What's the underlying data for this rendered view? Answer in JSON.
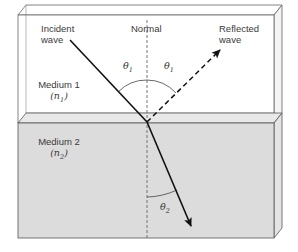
{
  "diagram": {
    "labels": {
      "incident_line1": "Incident",
      "incident_line2": "wave",
      "normal": "Normal",
      "reflected_line1": "Reflected",
      "reflected_line2": "wave",
      "medium1": "Medium 1",
      "medium1_index_symbol": "n",
      "medium1_index_sub": "1",
      "medium2": "Medium 2",
      "medium2_index_symbol": "n",
      "medium2_index_sub": "2",
      "theta_symbol": "θ",
      "theta_incident_sub": "1",
      "theta_reflected_sub": "1",
      "theta_refracted_sub": "2"
    },
    "colors": {
      "medium1_fill": "#ffffff",
      "medium2_fill": "#d9d9d9",
      "medium2_top_fill": "#e6e6e6",
      "side_fill": "#eeeeee",
      "outline": "#555555",
      "ray": "#111111"
    },
    "rays": [
      {
        "name": "incident",
        "style": "solid",
        "from": [
          70,
          40
        ],
        "to": [
          147,
          122
        ]
      },
      {
        "name": "reflected",
        "style": "dashed",
        "from": [
          147,
          122
        ],
        "to": [
          222,
          48
        ]
      },
      {
        "name": "refracted",
        "style": "solid",
        "from": [
          147,
          122
        ],
        "to": [
          193,
          228
        ]
      }
    ]
  }
}
